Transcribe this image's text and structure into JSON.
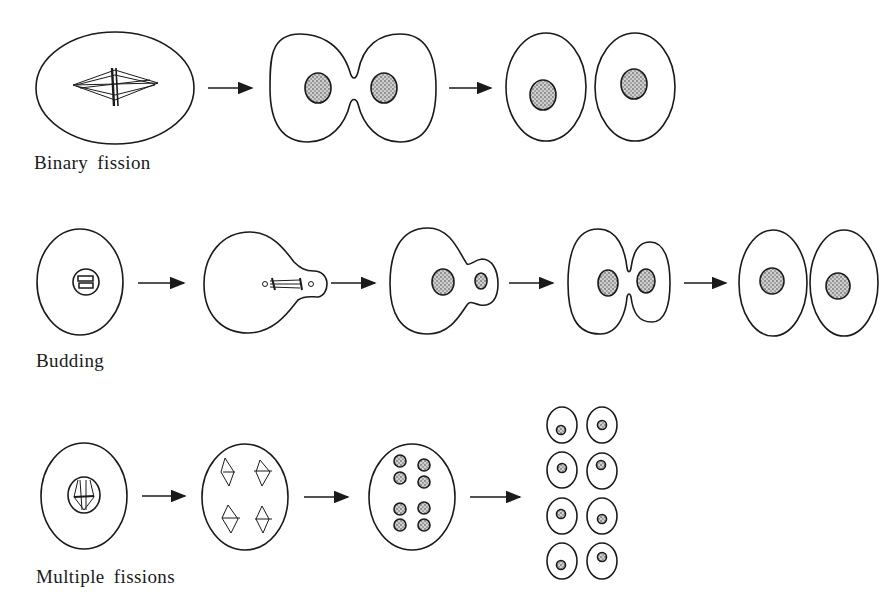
{
  "diagram": {
    "rows": [
      {
        "id": "binary-fission",
        "label": "Binary fission",
        "stages": [
          "parent cell with mitotic spindle",
          "constricting cell with two nuclei",
          "two daughter cells"
        ]
      },
      {
        "id": "budding",
        "label": "Budding",
        "stages": [
          "parent cell with nucleus",
          "cell forming bud with spindle",
          "bud with small nucleus",
          "bud enlarging",
          "two daughter cells"
        ]
      },
      {
        "id": "multiple-fissions",
        "label": "Multiple fissions",
        "stages": [
          "cell with dividing nucleus",
          "four spindles",
          "eight nuclei",
          "eight daughter cells"
        ]
      }
    ],
    "colors": {
      "stroke": "#1a1a1a",
      "nucleus_fill": "#9a9a9a",
      "background": "#ffffff"
    }
  }
}
